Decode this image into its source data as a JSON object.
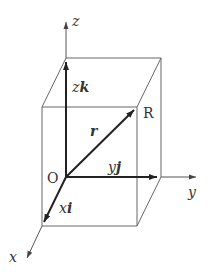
{
  "diagram": {
    "axes": {
      "x": {
        "label": "x"
      },
      "y": {
        "label": "y"
      },
      "z": {
        "label": "z"
      }
    },
    "points": {
      "origin": {
        "label": "O"
      },
      "point_r": {
        "label": "R"
      }
    },
    "vectors": {
      "r": {
        "label": "r"
      },
      "xi": {
        "coef": "x",
        "unit": "i"
      },
      "yj": {
        "coef": "y",
        "unit": "j"
      },
      "zk": {
        "coef": "z",
        "unit": "k"
      }
    },
    "colors": {
      "line": "#555555",
      "vector": "#222222",
      "text": "#333333"
    }
  }
}
